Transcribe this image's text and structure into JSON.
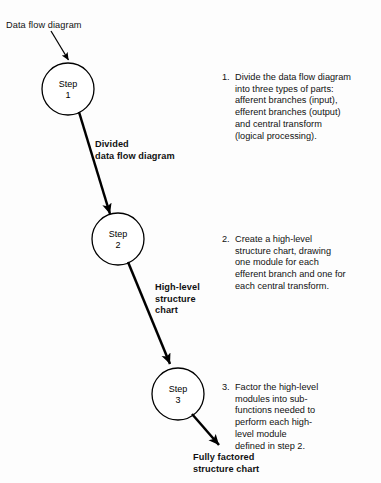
{
  "diagram": {
    "background_color": "#fdfdfd",
    "line_color": "#000000",
    "flow_labels": {
      "input": "Data flow diagram",
      "between_1_2": "Divided\ndata flow diagram",
      "between_2_3": "High-level\nstructure\nchart",
      "output": "Fully factored\nstructure chart"
    },
    "nodes": [
      {
        "id": "step1",
        "line1": "Step",
        "line2": "1",
        "cx": 68,
        "cy": 89,
        "r": 26
      },
      {
        "id": "step2",
        "line1": "Step",
        "line2": "2",
        "cx": 118,
        "cy": 239,
        "r": 26
      },
      {
        "id": "step3",
        "line1": "Step",
        "line2": "3",
        "cx": 178,
        "cy": 394,
        "r": 26
      }
    ]
  },
  "steps": [
    {
      "number": "1.",
      "text": "Divide the data flow diagram\ninto three types of parts:\nafferent branches (input),\nefferent branches (output)\nand central transform\n(logical processing)."
    },
    {
      "number": "2.",
      "text": "Create a high-level\nstructure chart, drawing\none module for each\nefferent branch and one for\neach central transform."
    },
    {
      "number": "3.",
      "text": "Factor the high-level\nmodules into sub-\nfunctions needed to\nperform each high-\nlevel module\ndefined in step 2."
    }
  ]
}
